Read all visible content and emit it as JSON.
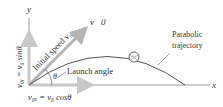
{
  "labels": {
    "y_axis": "y",
    "x_axis": "x",
    "velocity_vector": "v⃗0",
    "initial_speed": "Initial speed v₀",
    "launch_angle": "Launch angle",
    "theta": "θ",
    "trajectory_line1": "Parabolic",
    "trajectory_line2": "trajectory",
    "v0y_equation": "v₀ᵧ = v₀ sinθ",
    "v0x_equation": "v₀ₓ = v₀ cosθ"
  },
  "colors": {
    "axis": "#9a9a9a",
    "component_arrow": "#c8c8c8",
    "velocity_arrow": "#b5b5b5",
    "trajectory": "#555555",
    "text": "#333333"
  }
}
